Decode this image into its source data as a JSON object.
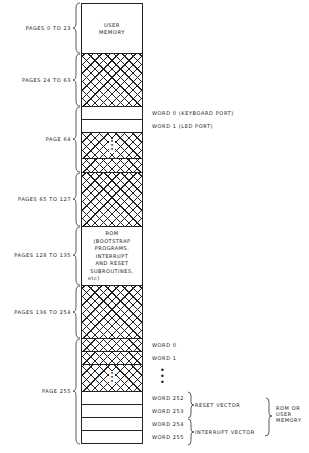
{
  "diagram": {
    "type": "memory-map",
    "regions": [
      {
        "label": "PAGES 0 TO 23",
        "content": "USER MEMORY",
        "top": 3,
        "bottom": 53,
        "hatched": false
      },
      {
        "label": "PAGES 24 TO 63",
        "content": "",
        "top": 53,
        "bottom": 106,
        "hatched": true
      },
      {
        "label": "PAGE 64",
        "content": "",
        "top": 106,
        "bottom": 172,
        "hatched": false,
        "words": [
          {
            "label": "WORD 0 (KEYBOARD PORT)"
          },
          {
            "label": "WORD 1 (LED PORT)"
          }
        ]
      },
      {
        "label": "PAGES 65 TO 127",
        "content": "",
        "top": 172,
        "bottom": 226,
        "hatched": true
      },
      {
        "label": "PAGES 128 TO 135",
        "content": "ROM (BOOTSTRAP PROGRAMS, INTERRUPT AND RESET SUBROUTINES, etc)",
        "top": 226,
        "bottom": 285,
        "hatched": false
      },
      {
        "label": "PAGES 136 TO 254",
        "content": "",
        "top": 285,
        "bottom": 338,
        "hatched": true
      },
      {
        "label": "PAGE 255",
        "content": "",
        "top": 338,
        "bottom": 444,
        "hatched": false,
        "words": [
          {
            "label": "WORD 0"
          },
          {
            "label": "WORD 1"
          },
          {
            "label": "⋮"
          },
          {
            "label": "WORD 252"
          },
          {
            "label": "WORD 253"
          },
          {
            "label": "WORD 254"
          },
          {
            "label": "WORD 255"
          }
        ]
      }
    ],
    "left_labels": {
      "p0_23": "PAGES 0 TO 23",
      "p24_63": "PAGES 24 TO 63",
      "p64": "PAGE 64",
      "p65_127": "PAGES 65 TO 127",
      "p128_135": "PAGES 128 TO 135",
      "p136_254": "PAGES 136 TO 254",
      "p255": "PAGE 255"
    },
    "cell_text": {
      "user_memory_1": "USER",
      "user_memory_2": "MEMORY",
      "rom_lines": [
        "ROM",
        "(BOOTSTRAP",
        "PROGRAMS,",
        "INTERRUPT",
        "AND RESET",
        "SUBROUTINES,",
        "etc)"
      ]
    },
    "right_labels": {
      "p64_w0": "WORD 0 (KEYBOARD PORT)",
      "p64_w1": "WORD 1 (LED PORT)",
      "p255_w0": "WORD 0",
      "p255_w1": "WORD 1",
      "p255_w252": "WORD 252",
      "p255_w253": "WORD 253",
      "p255_w254": "WORD 254",
      "p255_w255": "WORD 255",
      "reset_vector": "RESET VECTOR",
      "interrupt_vector": "INTERRUPT VECTOR",
      "rom_or_user_1": "ROM OR",
      "rom_or_user_2": "USER",
      "rom_or_user_3": "MEMORY"
    },
    "ellipsis": "⋮"
  }
}
